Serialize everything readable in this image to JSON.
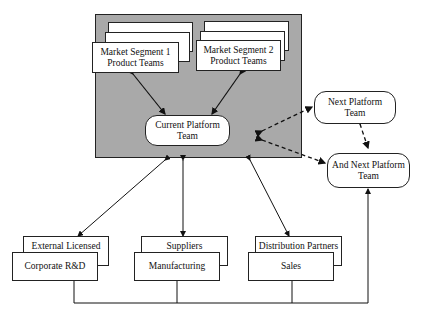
{
  "diagram": {
    "core_group": {
      "segment1": {
        "line1": "Market Segment 1",
        "line2": "Product Teams"
      },
      "segment2": {
        "line1": "Market Segment  2",
        "line2": "Product Teams"
      },
      "current_platform": {
        "line1": "Current Platform",
        "line2": "Team"
      }
    },
    "next_platform": {
      "line1": "Next Platform",
      "line2": "Team"
    },
    "and_next_platform": {
      "line1": "And Next Platform",
      "line2": "Team"
    },
    "functions": [
      {
        "back": "External Licensed R&D",
        "front": "Corporate R&D"
      },
      {
        "back": "Suppliers",
        "front": "Manufacturing"
      },
      {
        "back": "Distribution Partners",
        "front": "Sales"
      }
    ],
    "colors": {
      "shading": "#a9a9a9",
      "line": "#222222",
      "background": "#ffffff"
    }
  }
}
